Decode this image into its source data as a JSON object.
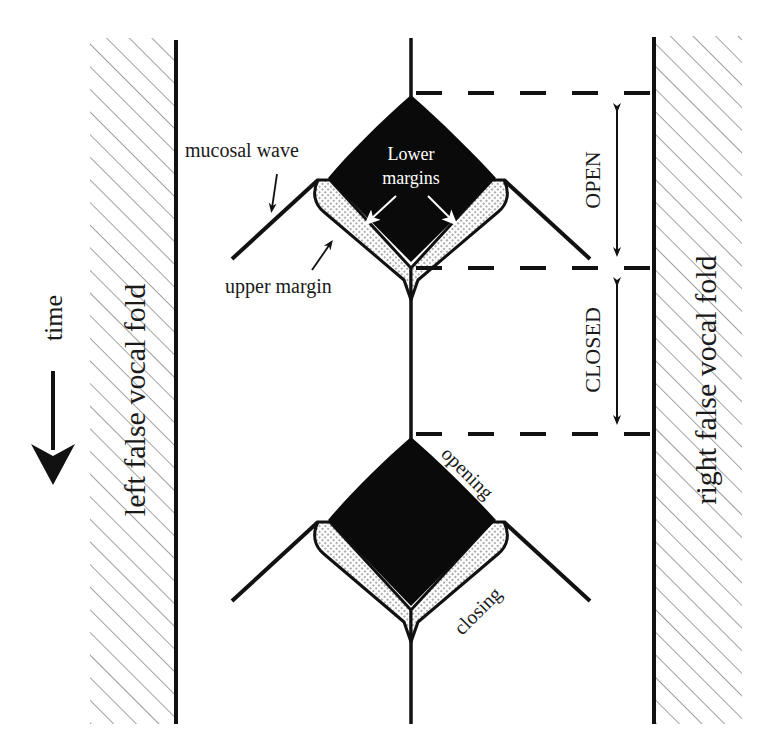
{
  "diagram": {
    "kind": "vocal fold vibration schematic",
    "colors": {
      "ink": "#111111",
      "hatch": "#8a8a8a",
      "background": "#ffffff",
      "white_label": "#ffffff"
    },
    "labels": {
      "left_wall": "left false vocal fold",
      "right_wall": "right false vocal fold",
      "time": "time",
      "mucosal_wave": "mucosal wave",
      "lower_margins_line1": "Lower",
      "lower_margins_line2": "margins",
      "upper_margin": "upper margin",
      "open": "OPEN",
      "closed": "CLOSED",
      "opening": "opening",
      "closing": "closing"
    },
    "phases": [
      {
        "name": "OPEN",
        "from_y": 92,
        "to_y": 268
      },
      {
        "name": "CLOSED",
        "from_y": 268,
        "to_y": 433
      }
    ],
    "icons": {
      "time_arrow": "arrow-down-icon",
      "phase_arrows": "double-headed-arrow-icon"
    }
  }
}
